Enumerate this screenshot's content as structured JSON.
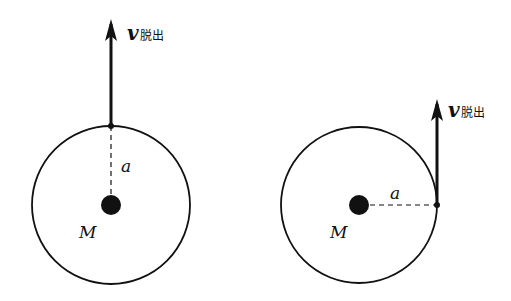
{
  "diagrams": [
    {
      "id": "left",
      "description": "escape velocity directed radially outward",
      "mass_label": "M",
      "radius_label": "a",
      "velocity_symbol": "v",
      "velocity_subscript": "脱出"
    },
    {
      "id": "right",
      "description": "escape velocity directed tangentially",
      "mass_label": "M",
      "radius_label": "a",
      "velocity_symbol": "v",
      "velocity_subscript": "脱出"
    }
  ],
  "colors": {
    "stroke": "#111111",
    "background": "#ffffff"
  }
}
